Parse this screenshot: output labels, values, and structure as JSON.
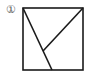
{
  "figure": {
    "label": "①",
    "stroke_color": "#1a1a1a",
    "square": {
      "x": 23,
      "y": 8,
      "size": 60
    },
    "lines": [
      {
        "name": "diagonal-left",
        "x1": 23,
        "y1": 8,
        "x2": 52,
        "y2": 70
      },
      {
        "name": "diagonal-right",
        "x1": 83,
        "y1": 8,
        "x2": 43,
        "y2": 51
      }
    ]
  }
}
